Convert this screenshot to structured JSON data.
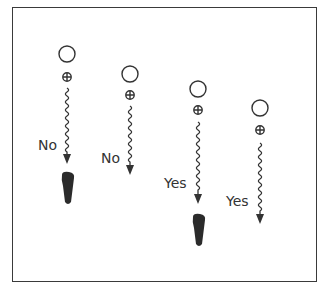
{
  "diagram": {
    "stroke_color": "#333333",
    "fill_color": "#2b2b2b",
    "columns": [
      {
        "id": 1,
        "x": 67,
        "circle_y": 54,
        "symbol_y": 77,
        "wave_top": 88,
        "wave_bottom": 152,
        "arrow_tip": 164,
        "label": "No",
        "label_x": 38,
        "label_y": 138,
        "has_foot": true,
        "foot_y": 172
      },
      {
        "id": 2,
        "x": 130,
        "circle_y": 74,
        "symbol_y": 95,
        "wave_top": 106,
        "wave_bottom": 163,
        "arrow_tip": 175,
        "label": "No",
        "label_x": 101,
        "label_y": 151,
        "has_foot": false
      },
      {
        "id": 3,
        "x": 198,
        "circle_y": 89,
        "symbol_y": 110,
        "wave_top": 122,
        "wave_bottom": 192,
        "arrow_tip": 204,
        "label": "Yes",
        "label_x": 164,
        "label_y": 176,
        "has_foot": true,
        "foot_y": 214
      },
      {
        "id": 4,
        "x": 260,
        "circle_y": 108,
        "symbol_y": 130,
        "wave_top": 143,
        "wave_bottom": 212,
        "arrow_tip": 224,
        "label": "Yes",
        "label_x": 226,
        "label_y": 194,
        "has_foot": false
      }
    ]
  }
}
